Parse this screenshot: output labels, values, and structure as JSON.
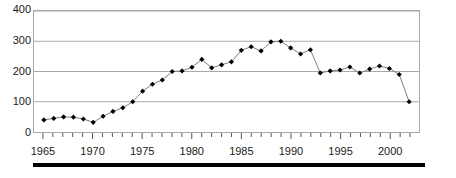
{
  "chart_data": {
    "type": "line",
    "title": "",
    "subtitle": "",
    "xlabel": "",
    "ylabel": "",
    "xlim": [
      1964,
      2003
    ],
    "ylim": [
      0,
      400
    ],
    "yticks": [
      0,
      100,
      200,
      300,
      400
    ],
    "ytick_labels": [
      "0",
      "100",
      "200",
      "300",
      "400"
    ],
    "xticks": [
      1965,
      1970,
      1975,
      1980,
      1985,
      1990,
      1995,
      2000
    ],
    "xtick_labels": [
      "1965",
      "1970",
      "1975",
      "1980",
      "1985",
      "1990",
      "1995",
      "2000"
    ],
    "xtick_minor_step": 1,
    "grid": "horizontal",
    "legend": "none",
    "marker": "diamond",
    "marker_color": "#000000",
    "line_color": "#808080",
    "grid_color": "#a8a8a8",
    "frame_color": "#a8a8a8",
    "x": [
      1965,
      1966,
      1967,
      1968,
      1969,
      1970,
      1971,
      1972,
      1973,
      1974,
      1975,
      1976,
      1977,
      1978,
      1979,
      1980,
      1981,
      1982,
      1983,
      1984,
      1985,
      1986,
      1987,
      1988,
      1989,
      1990,
      1991,
      1992,
      1993,
      1994,
      1995,
      1996,
      1997,
      1998,
      1999,
      2000,
      2001,
      2002
    ],
    "values": [
      40,
      45,
      50,
      49,
      43,
      32,
      52,
      68,
      80,
      100,
      135,
      158,
      172,
      200,
      202,
      214,
      240,
      212,
      222,
      232,
      270,
      282,
      268,
      298,
      300,
      278,
      258,
      272,
      195,
      202,
      205,
      215,
      195,
      208,
      218,
      210,
      190,
      100
    ],
    "series": [
      {
        "name": "series-1",
        "values": [
          40,
          45,
          50,
          49,
          43,
          32,
          52,
          68,
          80,
          100,
          135,
          158,
          172,
          200,
          202,
          214,
          240,
          212,
          222,
          232,
          270,
          282,
          268,
          298,
          300,
          278,
          258,
          272,
          195,
          202,
          205,
          215,
          195,
          208,
          218,
          210,
          190,
          100
        ]
      }
    ]
  }
}
